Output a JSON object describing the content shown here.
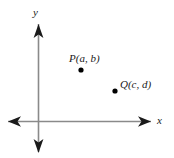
{
  "figure": {
    "background_color": "#ffffff",
    "axis_color": "#8a8a8a",
    "arrow_color": "#1a1a1a",
    "point_color": "#000000",
    "text_color": "#1a1a1a",
    "axes": {
      "origin": {
        "x": 38.5,
        "y": 121.5
      },
      "x_axis": {
        "from_x": 8,
        "to_x": 151,
        "y": 121.5
      },
      "y_axis": {
        "x": 38.5,
        "from_y": 26,
        "to_y": 152
      },
      "x_label": "x",
      "y_label": "y"
    },
    "points": [
      {
        "id": "P",
        "label": "P(a, b)",
        "coordinate_names": {
          "x": "a",
          "y": "b"
        },
        "dot": {
          "x": 81,
          "y": 70,
          "radius": 2.6
        },
        "label_position": "above-left"
      },
      {
        "id": "Q",
        "label": "Q(c, d)",
        "coordinate_names": {
          "x": "c",
          "y": "d"
        },
        "dot": {
          "x": 115,
          "y": 91,
          "radius": 2.6
        },
        "label_position": "right"
      }
    ]
  }
}
